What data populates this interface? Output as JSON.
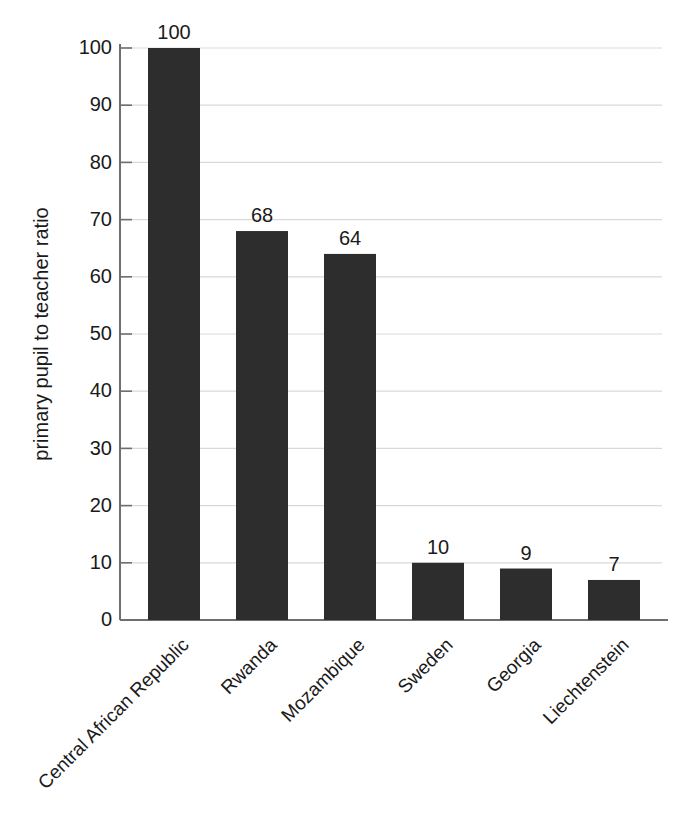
{
  "chart_data": {
    "type": "bar",
    "title": "",
    "xlabel": "",
    "ylabel": "primary pupil to teacher ratio",
    "categories": [
      "Central African Republic",
      "Rwanda",
      "Mozambique",
      "Sweden",
      "Georgia",
      "Liechtenstein"
    ],
    "values": [
      100,
      68,
      64,
      10,
      9,
      7
    ],
    "value_labels": [
      "100",
      "68",
      "64",
      "10",
      "9",
      "7"
    ],
    "ylim": [
      0,
      100
    ],
    "ytick_labels": [
      "0",
      "10",
      "20",
      "30",
      "40",
      "50",
      "60",
      "70",
      "80",
      "90",
      "100"
    ],
    "ytick_values": [
      0,
      10,
      20,
      30,
      40,
      50,
      60,
      70,
      80,
      90,
      100
    ],
    "grid": true,
    "legend": false,
    "legend_position": "none",
    "bar_color": "#2d2d2d",
    "gridline_color": "#d9d9d9",
    "axis_color": "#6f6f6f",
    "background_color": "#ffffff",
    "category_label_rotation": "-45"
  }
}
